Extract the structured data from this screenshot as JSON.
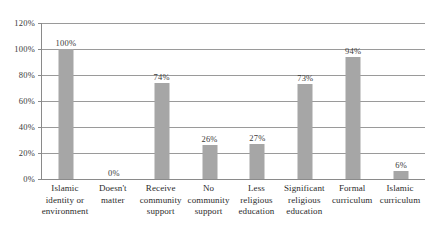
{
  "chart_data": {
    "type": "bar",
    "title": "",
    "subtitle": "",
    "xlabel": "",
    "ylabel": "",
    "ylim": [
      0,
      120
    ],
    "ytick_labels": [
      "0%",
      "20%",
      "40%",
      "60%",
      "80%",
      "100%",
      "120%"
    ],
    "ytick_values": [
      0,
      20,
      40,
      60,
      80,
      100,
      120
    ],
    "grid": true,
    "legend": "none",
    "bar_color": "#a6a6a6",
    "gridline_color": "#9a9a9a",
    "axis_color": "#8a8a8a",
    "categories": [
      "Islamic identity or environment",
      "Doesn't matter",
      "Receive community support",
      "No community support",
      "Less religious education",
      "Significant religious education",
      "Formal curriculum",
      "Islamic curriculum"
    ],
    "category_lines": [
      [
        "Islamic",
        "identity or",
        "environment"
      ],
      [
        "Doesn't",
        "matter"
      ],
      [
        "Receive",
        "community",
        "support"
      ],
      [
        "No",
        "community",
        "support"
      ],
      [
        "Less",
        "religious",
        "education"
      ],
      [
        "Significant",
        "religious",
        "education"
      ],
      [
        "Formal",
        "curriculum"
      ],
      [
        "Islamic",
        "curriculum"
      ]
    ],
    "values": [
      100,
      0,
      74,
      26,
      27,
      73,
      94,
      6
    ],
    "data_labels": [
      "100%",
      "0%",
      "74%",
      "26%",
      "27%",
      "73%",
      "94%",
      "6%"
    ]
  }
}
